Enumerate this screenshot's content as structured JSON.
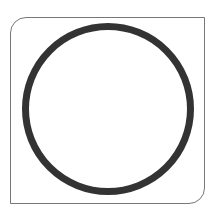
{
  "figure": {
    "caption_fragment": "",
    "shape": "circle",
    "stroke_color": "#333333",
    "frame_color": "#777777",
    "background": "#ffffff"
  }
}
